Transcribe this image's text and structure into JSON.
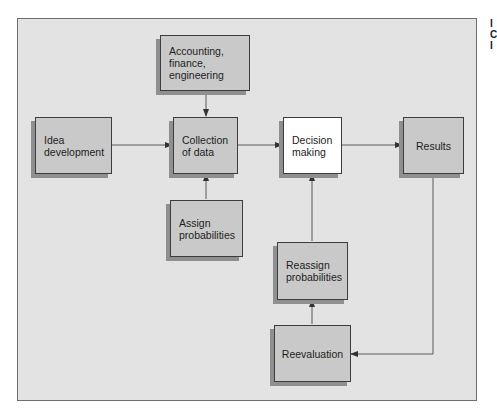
{
  "diagram": {
    "nodes": [
      {
        "id": "accounting",
        "label": "Accounting,\nfinance,\nengineering"
      },
      {
        "id": "idea",
        "label": "Idea\ndevelopment"
      },
      {
        "id": "collection",
        "label": "Collection\nof data"
      },
      {
        "id": "decision",
        "label": "Decision\nmaking"
      },
      {
        "id": "results",
        "label": "Results"
      },
      {
        "id": "assign",
        "label": "Assign\nprobabilities"
      },
      {
        "id": "reassign",
        "label": "Reassign\nprobabilities"
      },
      {
        "id": "reevaluation",
        "label": "Reevaluation"
      }
    ],
    "edges": [
      {
        "from": "accounting",
        "to": "collection"
      },
      {
        "from": "idea",
        "to": "collection"
      },
      {
        "from": "assign",
        "to": "collection"
      },
      {
        "from": "collection",
        "to": "decision"
      },
      {
        "from": "decision",
        "to": "results"
      },
      {
        "from": "results",
        "to": "reevaluation"
      },
      {
        "from": "reevaluation",
        "to": "reassign"
      },
      {
        "from": "reassign",
        "to": "decision"
      }
    ],
    "side_text": "I\nC\nI"
  },
  "colors": {
    "frame_bg": "#e3e3e3",
    "box_fill": "#c9c9c9",
    "highlight_fill": "#ffffff",
    "line": "#555555"
  }
}
